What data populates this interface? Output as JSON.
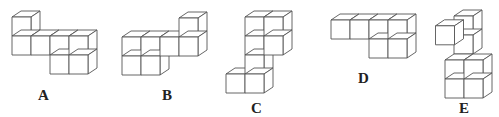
{
  "figures": [
    {
      "label": "A",
      "label_pos": [
        43,
        99
      ]
    },
    {
      "label": "B",
      "label_pos": [
        162,
        99
      ]
    },
    {
      "label": "C",
      "label_pos": [
        253,
        116
      ]
    },
    {
      "label": "D",
      "label_pos": [
        360,
        81
      ]
    },
    {
      "label": "E",
      "label_pos": [
        459,
        116
      ]
    }
  ],
  "style": {
    "stroke": "#555555",
    "fill": "#ffffff"
  }
}
